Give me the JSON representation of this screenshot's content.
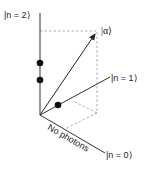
{
  "diagram": {
    "type": "fock-state-vector-space",
    "axes": [
      {
        "id": "n2",
        "label": "|n = 2⟩"
      },
      {
        "id": "n1",
        "label": "|n = 1⟩"
      },
      {
        "id": "n0",
        "label": "|n = 0⟩"
      }
    ],
    "vector": {
      "label": "|α⟩"
    },
    "annotation": {
      "label": "No photons"
    },
    "dots_on_n2_axis": 2,
    "dots_on_n1_axis": 1,
    "colors": {
      "line": "#333333",
      "dashed": "#999999",
      "dot": "#111111"
    }
  }
}
